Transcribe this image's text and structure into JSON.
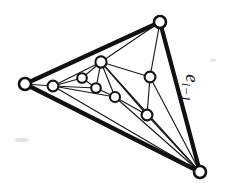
{
  "figure": {
    "background_color": "#fefefe",
    "ink_color": "#111111",
    "width": 225,
    "height": 183,
    "labels": [
      {
        "id": "edge-label-e-i-minus-1",
        "text": "e",
        "subscript": "i−1",
        "full_text": "e_{i-1}",
        "x": 186,
        "y": 88,
        "rotation_deg": 90,
        "target_edge": "top-vertex-to-bottom-right-vertex"
      }
    ],
    "outer_triangle": {
      "stroke_width": 4.2,
      "vertex_ids": [
        "v-top",
        "v-left",
        "v-bottom-right"
      ],
      "edges": [
        [
          "v-left",
          "v-top"
        ],
        [
          "v-top",
          "v-bottom-right"
        ],
        [
          "v-bottom-right",
          "v-left"
        ]
      ]
    },
    "vertices": [
      {
        "id": "v-top",
        "x": 160,
        "y": 22,
        "r": 6.0,
        "kind": "outer"
      },
      {
        "id": "v-left",
        "x": 25,
        "y": 84,
        "r": 6.0,
        "kind": "outer"
      },
      {
        "id": "v-bottom-right",
        "x": 200,
        "y": 172,
        "r": 6.0,
        "kind": "outer"
      },
      {
        "id": "v-hub",
        "x": 101,
        "y": 62,
        "r": 5.6,
        "kind": "inner"
      },
      {
        "id": "v-inner-left",
        "x": 53,
        "y": 86,
        "r": 5.4,
        "kind": "inner"
      },
      {
        "id": "v-small-upper",
        "x": 82,
        "y": 78,
        "r": 4.8,
        "kind": "inner"
      },
      {
        "id": "v-small-lower",
        "x": 96,
        "y": 88,
        "r": 4.8,
        "kind": "inner"
      },
      {
        "id": "v-mid-low",
        "x": 115,
        "y": 97,
        "r": 5.0,
        "kind": "inner"
      },
      {
        "id": "v-right-upper",
        "x": 150,
        "y": 77,
        "r": 5.4,
        "kind": "inner"
      },
      {
        "id": "v-right-lower",
        "x": 147,
        "y": 115,
        "r": 5.4,
        "kind": "inner"
      }
    ],
    "inner_edges": [
      [
        "v-left",
        "v-inner-left"
      ],
      [
        "v-inner-left",
        "v-hub"
      ],
      [
        "v-inner-left",
        "v-small-upper"
      ],
      [
        "v-inner-left",
        "v-small-lower"
      ],
      [
        "v-inner-left",
        "v-mid-low"
      ],
      [
        "v-hub",
        "v-small-upper"
      ],
      [
        "v-hub",
        "v-small-lower"
      ],
      [
        "v-small-upper",
        "v-small-lower"
      ],
      [
        "v-hub",
        "v-mid-low"
      ],
      [
        "v-small-lower",
        "v-mid-low"
      ],
      [
        "v-hub",
        "v-right-upper"
      ],
      [
        "v-hub",
        "v-right-lower"
      ],
      [
        "v-hub",
        "v-top"
      ],
      [
        "v-right-upper",
        "v-top"
      ],
      [
        "v-right-upper",
        "v-right-lower"
      ],
      [
        "v-mid-low",
        "v-right-lower"
      ],
      [
        "v-right-upper",
        "v-bottom-right"
      ],
      [
        "v-right-lower",
        "v-bottom-right"
      ],
      [
        "v-mid-low",
        "v-bottom-right"
      ],
      [
        "v-hub",
        "v-bottom-right"
      ],
      [
        "v-inner-left",
        "v-bottom-right"
      ]
    ],
    "counts": {
      "total_vertices": 10,
      "outer_vertices": 3,
      "inner_vertices": 7,
      "thick_edges": 3,
      "thin_edges": 21
    }
  }
}
